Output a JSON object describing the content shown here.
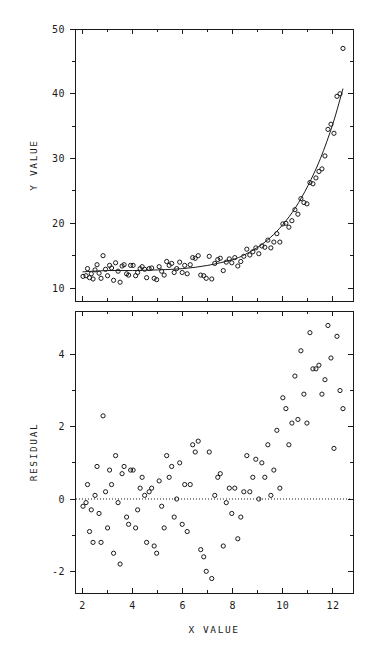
{
  "figure": {
    "background_color": "#ffffff",
    "ink_color": "#1a1a1a"
  },
  "chart_data": [
    {
      "type": "scatter",
      "panel": "top",
      "title": "",
      "xlabel": "",
      "ylabel": "Y VALUE",
      "xlim": [
        1.7,
        12.8
      ],
      "ylim": [
        8.0,
        50.0
      ],
      "xticks": [
        2,
        4,
        6,
        8,
        10,
        12
      ],
      "xtick_labels": [
        "2",
        "4",
        "6",
        "8",
        "10",
        "12"
      ],
      "yticks": [
        10,
        20,
        30,
        40,
        50
      ],
      "ytick_labels": [
        "10",
        "20",
        "30",
        "40",
        "50"
      ],
      "minor_xticks": [
        3,
        5,
        7,
        9,
        11
      ],
      "minor_yticks": [
        15,
        25,
        35,
        45
      ],
      "grid": false,
      "legend": "none",
      "marker": "open-circle",
      "series": [
        {
          "name": "observed",
          "x": [
            2.02,
            2.14,
            2.2,
            2.28,
            2.35,
            2.42,
            2.5,
            2.58,
            2.66,
            2.74,
            2.82,
            2.92,
            3.0,
            3.08,
            3.16,
            3.24,
            3.32,
            3.42,
            3.5,
            3.58,
            3.66,
            3.76,
            3.84,
            3.92,
            4.02,
            4.12,
            4.2,
            4.3,
            4.38,
            4.48,
            4.56,
            4.66,
            4.76,
            4.86,
            4.96,
            5.06,
            5.16,
            5.26,
            5.36,
            5.46,
            5.56,
            5.66,
            5.76,
            5.88,
            5.98,
            6.08,
            6.18,
            6.3,
            6.4,
            6.5,
            6.62,
            6.72,
            6.84,
            6.94,
            7.06,
            7.16,
            7.28,
            7.4,
            7.5,
            7.62,
            7.74,
            7.86,
            7.96,
            8.08,
            8.2,
            8.32,
            8.44,
            8.56,
            8.68,
            8.8,
            8.92,
            9.04,
            9.16,
            9.28,
            9.4,
            9.52,
            9.64,
            9.76,
            9.88,
            10.0,
            10.12,
            10.24,
            10.36,
            10.48,
            10.6,
            10.72,
            10.84,
            10.96,
            11.08,
            11.2,
            11.32,
            11.44,
            11.56,
            11.68,
            11.8,
            11.92,
            12.04,
            12.16,
            12.28,
            12.4
          ],
          "y": [
            11.8,
            11.9,
            13.0,
            11.6,
            12.2,
            11.4,
            12.8,
            13.6,
            12.3,
            11.5,
            15.0,
            12.9,
            11.9,
            13.5,
            13.1,
            11.2,
            13.9,
            12.6,
            10.9,
            13.4,
            13.6,
            12.2,
            12.0,
            13.5,
            13.5,
            11.9,
            12.4,
            13.0,
            13.3,
            12.9,
            11.6,
            13.0,
            13.1,
            11.5,
            11.3,
            13.3,
            12.6,
            12.0,
            14.1,
            13.5,
            13.8,
            12.4,
            13.0,
            14.0,
            12.4,
            13.5,
            12.2,
            13.6,
            14.7,
            14.6,
            15.0,
            12.0,
            11.9,
            11.5,
            14.9,
            11.4,
            13.8,
            14.4,
            14.6,
            12.7,
            14.0,
            14.5,
            13.9,
            14.7,
            13.4,
            14.1,
            14.9,
            16.0,
            15.1,
            15.6,
            16.2,
            15.3,
            16.5,
            16.3,
            17.4,
            16.2,
            17.1,
            18.4,
            17.1,
            19.9,
            20.0,
            19.4,
            20.4,
            22.1,
            21.4,
            23.8,
            23.2,
            23.0,
            26.3,
            26.1,
            27.0,
            28.0,
            28.4,
            30.4,
            34.5,
            35.3,
            33.9,
            39.6,
            40.0,
            47.0
          ]
        },
        {
          "name": "fitted-exponential",
          "x_start": 2.0,
          "x_end": 12.4,
          "description": "nonlinear least squares exponential fit curve",
          "fit_points_x": [
            2.0,
            3.0,
            4.0,
            5.0,
            6.0,
            7.0,
            8.0,
            8.5,
            9.0,
            9.5,
            10.0,
            10.5,
            11.0,
            11.5,
            12.0,
            12.4
          ],
          "fit_points_y": [
            12.5,
            12.7,
            12.7,
            12.8,
            13.0,
            13.5,
            14.4,
            15.2,
            16.3,
            17.8,
            19.8,
            22.4,
            25.8,
            30.0,
            35.4,
            40.8
          ]
        }
      ]
    },
    {
      "type": "scatter",
      "panel": "bottom",
      "title": "",
      "xlabel": "X VALUE",
      "ylabel": "RESIDUAL",
      "xlim": [
        1.7,
        12.8
      ],
      "ylim": [
        -2.6,
        5.2
      ],
      "xticks": [
        2,
        4,
        6,
        8,
        10,
        12
      ],
      "xtick_labels": [
        "2",
        "4",
        "6",
        "8",
        "10",
        "12"
      ],
      "yticks": [
        -2,
        0,
        2,
        4
      ],
      "ytick_labels": [
        "-2",
        "0",
        "2",
        "4"
      ],
      "minor_xticks": [
        3,
        5,
        7,
        9,
        11
      ],
      "minor_yticks": [
        -1,
        1,
        3
      ],
      "grid": false,
      "legend": "none",
      "marker": "open-circle",
      "reference_line": {
        "y": 0,
        "style": "dotted"
      },
      "series": [
        {
          "name": "residual",
          "x": [
            2.02,
            2.14,
            2.2,
            2.28,
            2.35,
            2.42,
            2.5,
            2.58,
            2.66,
            2.74,
            2.82,
            2.92,
            3.0,
            3.08,
            3.16,
            3.24,
            3.32,
            3.42,
            3.5,
            3.58,
            3.66,
            3.76,
            3.84,
            3.92,
            4.02,
            4.12,
            4.2,
            4.3,
            4.38,
            4.48,
            4.56,
            4.66,
            4.76,
            4.86,
            4.96,
            5.06,
            5.16,
            5.26,
            5.36,
            5.46,
            5.56,
            5.66,
            5.76,
            5.88,
            5.98,
            6.08,
            6.18,
            6.3,
            6.4,
            6.5,
            6.62,
            6.72,
            6.84,
            6.94,
            7.06,
            7.16,
            7.28,
            7.4,
            7.5,
            7.62,
            7.74,
            7.86,
            7.96,
            8.08,
            8.2,
            8.32,
            8.44,
            8.56,
            8.68,
            8.8,
            8.92,
            9.04,
            9.16,
            9.28,
            9.4,
            9.52,
            9.64,
            9.76,
            9.88,
            10.0,
            10.12,
            10.24,
            10.36,
            10.48,
            10.6,
            10.72,
            10.84,
            10.96,
            11.08,
            11.2,
            11.32,
            11.44,
            11.56,
            11.68,
            11.8,
            11.92,
            12.04,
            12.16,
            12.28,
            12.4
          ],
          "y": [
            -0.2,
            -0.1,
            0.4,
            -0.9,
            -0.3,
            -1.2,
            0.1,
            0.9,
            -0.4,
            -1.2,
            2.3,
            0.2,
            -0.8,
            0.8,
            0.4,
            -1.5,
            1.2,
            -0.1,
            -1.8,
            0.7,
            0.9,
            -0.5,
            -0.7,
            0.8,
            0.8,
            -0.8,
            -0.3,
            0.3,
            0.6,
            0.1,
            -1.2,
            0.2,
            0.3,
            -1.3,
            -1.5,
            0.5,
            -0.2,
            -0.8,
            1.2,
            0.6,
            0.9,
            -0.5,
            0.0,
            1.0,
            -0.7,
            0.4,
            -0.9,
            0.4,
            1.5,
            1.3,
            1.6,
            -1.4,
            -1.6,
            -2.0,
            1.3,
            -2.2,
            0.1,
            0.6,
            0.7,
            -1.3,
            -0.1,
            0.3,
            -0.4,
            0.3,
            -1.1,
            -0.5,
            0.2,
            1.2,
            0.2,
            0.6,
            1.1,
            0.0,
            1.0,
            0.6,
            1.5,
            0.1,
            0.8,
            1.9,
            0.3,
            2.8,
            2.5,
            1.5,
            2.1,
            3.4,
            2.2,
            4.1,
            2.9,
            2.1,
            4.6,
            3.6,
            3.6,
            3.7,
            2.9,
            3.3,
            4.8,
            3.9,
            1.4,
            4.5,
            3.0,
            2.5
          ]
        }
      ]
    }
  ]
}
